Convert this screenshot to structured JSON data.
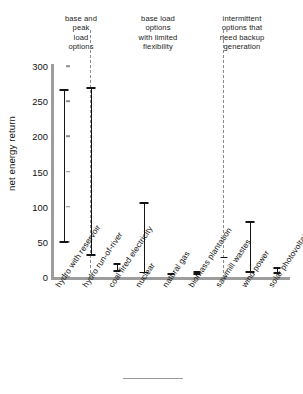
{
  "chart_data": {
    "type": "bar",
    "subtype": "range-bars",
    "title": "",
    "xlabel": "",
    "ylabel": "net energy return",
    "ylim": [
      0,
      310
    ],
    "yticks": [
      0,
      50,
      100,
      150,
      200,
      250,
      300
    ],
    "grid": false,
    "legend": null,
    "categories": [
      "hydro with reservoir",
      "hydro run-of-river",
      "coal fired electricity",
      "nuclear",
      "natural gas",
      "biomass plantation",
      "sawmill wastes",
      "wind power",
      "solar photovoltaic"
    ],
    "ranges": [
      {
        "category": "hydro with reservoir",
        "low": 48,
        "high": 267
      },
      {
        "category": "hydro run-of-river",
        "low": 30,
        "high": 270
      },
      {
        "category": "coal fired electricity",
        "low": 7,
        "high": 20
      },
      {
        "category": "nuclear",
        "low": 5,
        "high": 107
      },
      {
        "category": "natural gas",
        "low": 4,
        "high": 5
      },
      {
        "category": "biomass plantation",
        "low": 3,
        "high": 9
      },
      {
        "category": "sawmill wastes",
        "low": 27,
        "high": 29
      },
      {
        "category": "wind power",
        "low": 6,
        "high": 80
      },
      {
        "category": "solar photovoltaic",
        "low": 4,
        "high": 14
      }
    ],
    "groups": [
      {
        "label": "base and\npeak\nload\noptions",
        "categories": [
          "hydro with reservoir"
        ]
      },
      {
        "label": "base load\noptions\nwith limited\nflexibility",
        "categories": [
          "hydro run-of-river",
          "coal fired electricity",
          "nuclear",
          "natural gas",
          "biomass plantation",
          "sawmill wastes"
        ]
      },
      {
        "label": "intermittent\noptions that\nneed backup\ngeneration",
        "categories": [
          "wind power",
          "solar photovoltaic"
        ]
      }
    ],
    "annotations": {
      "dividers": [
        2,
        7
      ]
    },
    "colors": {
      "bar": "#141414",
      "axis": "#9d9d9d",
      "divider": "#8a8a8a",
      "text": "#1a1a1a"
    }
  },
  "axis": {
    "ytick_labels": [
      "300",
      "250",
      "200",
      "150",
      "100",
      "50",
      "0"
    ],
    "ylabel": "net energy return"
  },
  "headers": {
    "peak": "base and\npeak\nload\noptions",
    "baseload": "base load\noptions\nwith limited\nflexibility",
    "intermittent": "intermittent\noptions that\nneed backup\ngeneration"
  },
  "xlabels": [
    "hydro with reservoir",
    "hydro run-of-river",
    "coal fired electricity",
    "nuclear",
    "natural gas",
    "biomass plantation",
    "sawmill wastes",
    "wind power",
    "solar photovoltaic"
  ]
}
